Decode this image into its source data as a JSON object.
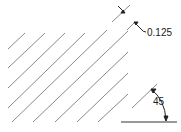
{
  "diagram": {
    "hatch": {
      "angle_deg": 45,
      "spacing": 0.125,
      "line_color": "#8a8a8a",
      "lines": [
        {
          "x1": 8,
          "y1": 49,
          "x2": 25,
          "y2": 33
        },
        {
          "x1": 8,
          "y1": 68,
          "x2": 45,
          "y2": 33
        },
        {
          "x1": 8,
          "y1": 88,
          "x2": 65,
          "y2": 33
        },
        {
          "x1": 8,
          "y1": 108,
          "x2": 85,
          "y2": 33
        },
        {
          "x1": 12,
          "y1": 122,
          "x2": 107,
          "y2": 30
        },
        {
          "x1": 33,
          "y1": 122,
          "x2": 128,
          "y2": 31
        },
        {
          "x1": 55,
          "y1": 122,
          "x2": 128,
          "y2": 52
        },
        {
          "x1": 77,
          "y1": 122,
          "x2": 128,
          "y2": 73
        },
        {
          "x1": 98,
          "y1": 122,
          "x2": 128,
          "y2": 94
        },
        {
          "x1": 112,
          "y1": 22,
          "x2": 130,
          "y2": 5
        },
        {
          "x1": 127,
          "y1": 30,
          "x2": 135,
          "y2": 22
        },
        {
          "x1": 132,
          "y1": 108,
          "x2": 157,
          "y2": 84
        }
      ]
    },
    "dimensions": {
      "spacing_label": "0.125",
      "angle_label": "45"
    },
    "baseline": {
      "x1": 121,
      "y1": 122,
      "x2": 177,
      "y2": 122
    }
  }
}
